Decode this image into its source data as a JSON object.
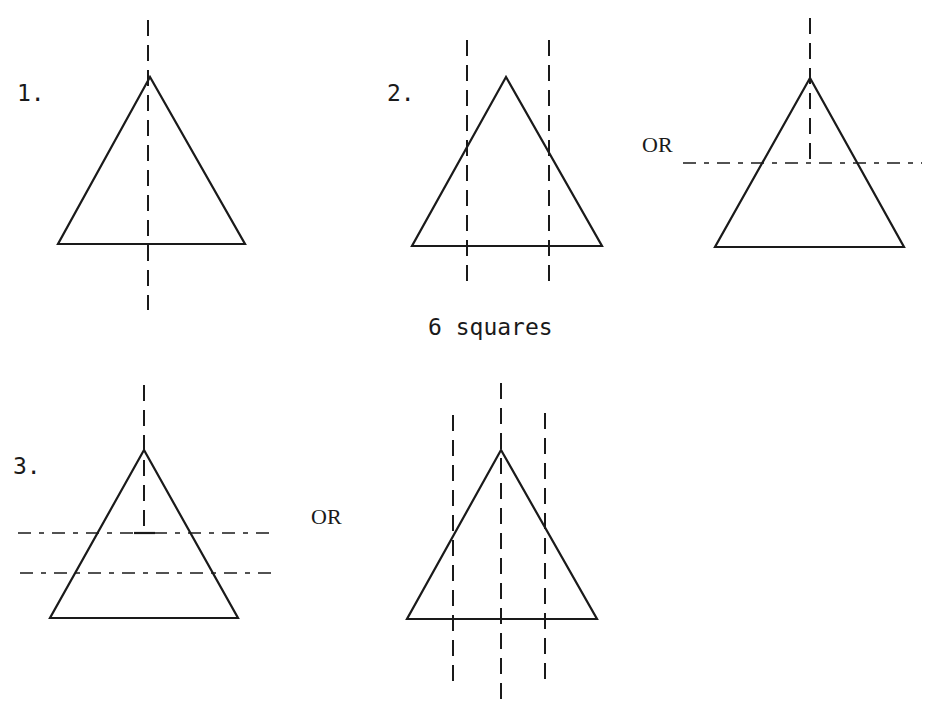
{
  "page": {
    "width": 926,
    "height": 710,
    "ink_color": "#1a1a1a",
    "background": "#ffffff"
  },
  "labels": {
    "fig1": "1.",
    "fig2": "2.",
    "fig2_or": "OR",
    "caption": "6 squares",
    "fig3": "3.",
    "fig3_or": "OR"
  },
  "label_positions": {
    "fig1": {
      "x": 17,
      "y": 82,
      "style": "mono"
    },
    "fig2": {
      "x": 387,
      "y": 82,
      "style": "mono"
    },
    "fig2_or": {
      "x": 642,
      "y": 134,
      "style": "serif"
    },
    "caption": {
      "x": 428,
      "y": 316,
      "style": "mono"
    },
    "fig3": {
      "x": 13,
      "y": 455,
      "style": "mono"
    },
    "fig3_or": {
      "x": 311,
      "y": 506,
      "style": "serif"
    }
  },
  "figures": [
    {
      "id": "figure-1",
      "triangle": {
        "apex": [
          150,
          77
        ],
        "left": [
          58,
          244
        ],
        "right": [
          245,
          244
        ]
      },
      "vertical_cuts": [
        {
          "x": 148,
          "y1": 20,
          "y2": 310
        }
      ],
      "horizontal_cuts": [],
      "ticks": []
    },
    {
      "id": "figure-2a",
      "triangle": {
        "apex": [
          506,
          77
        ],
        "left": [
          412,
          246
        ],
        "right": [
          602,
          246
        ]
      },
      "vertical_cuts": [
        {
          "x": 467,
          "y1": 40,
          "y2": 286
        },
        {
          "x": 549,
          "y1": 40,
          "y2": 286
        }
      ],
      "horizontal_cuts": [],
      "ticks": []
    },
    {
      "id": "figure-2b",
      "triangle": {
        "apex": [
          810,
          78
        ],
        "left": [
          715,
          247
        ],
        "right": [
          904,
          247
        ]
      },
      "vertical_cuts": [
        {
          "x": 810,
          "y1": 18,
          "y2": 160
        }
      ],
      "horizontal_cuts": [
        {
          "y": 163,
          "x1": 683,
          "x2": 922
        }
      ],
      "ticks": []
    },
    {
      "id": "figure-3a",
      "triangle": {
        "apex": [
          144,
          450
        ],
        "left": [
          50,
          618
        ],
        "right": [
          238,
          618
        ]
      },
      "vertical_cuts": [
        {
          "x": 144,
          "y1": 385,
          "y2": 533
        }
      ],
      "horizontal_cuts": [
        {
          "y": 533,
          "x1": 18,
          "x2": 277
        },
        {
          "y": 573,
          "x1": 20,
          "x2": 279
        }
      ],
      "ticks": [
        {
          "x1": 134,
          "y1": 533,
          "x2": 155,
          "y2": 533
        }
      ]
    },
    {
      "id": "figure-3b",
      "triangle": {
        "apex": [
          501,
          450
        ],
        "left": [
          407,
          619
        ],
        "right": [
          597,
          619
        ]
      },
      "vertical_cuts": [
        {
          "x": 453,
          "y1": 415,
          "y2": 682
        },
        {
          "x": 501,
          "y1": 383,
          "y2": 707
        },
        {
          "x": 545,
          "y1": 413,
          "y2": 688
        }
      ],
      "horizontal_cuts": [],
      "ticks": []
    }
  ]
}
